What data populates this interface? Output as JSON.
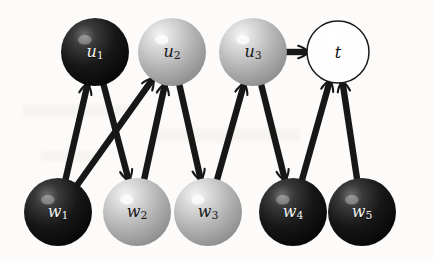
{
  "figure": {
    "kind": "bipartite-graph-diagram",
    "background_color": "#fcfbf9",
    "edge_color": "#171717",
    "node_dark_color": "#161616",
    "node_light_color": "#b9b9b9",
    "node_open_color": "#ffffff",
    "width": 433,
    "height": 261
  },
  "nodes": [
    {
      "id": "u1",
      "label": "u",
      "sub": "1",
      "x": 95,
      "y": 52,
      "r": 34,
      "shade": "dark",
      "row": "top"
    },
    {
      "id": "u2",
      "label": "u",
      "sub": "2",
      "x": 172,
      "y": 52,
      "r": 34,
      "shade": "light",
      "row": "top"
    },
    {
      "id": "u3",
      "label": "u",
      "sub": "3",
      "x": 253,
      "y": 52,
      "r": 34,
      "shade": "light",
      "row": "top"
    },
    {
      "id": "t",
      "label": "t",
      "sub": "",
      "x": 338,
      "y": 52,
      "r": 31,
      "shade": "open",
      "row": "top"
    },
    {
      "id": "w1",
      "label": "w",
      "sub": "1",
      "x": 58,
      "y": 212,
      "r": 34,
      "shade": "dark",
      "row": "bottom"
    },
    {
      "id": "w2",
      "label": "w",
      "sub": "2",
      "x": 137,
      "y": 212,
      "r": 34,
      "shade": "light",
      "row": "bottom"
    },
    {
      "id": "w3",
      "label": "w",
      "sub": "3",
      "x": 208,
      "y": 212,
      "r": 34,
      "shade": "light",
      "row": "bottom"
    },
    {
      "id": "w4",
      "label": "w",
      "sub": "4",
      "x": 293,
      "y": 212,
      "r": 34,
      "shade": "dark",
      "row": "bottom"
    },
    {
      "id": "w5",
      "label": "w",
      "sub": "5",
      "x": 362,
      "y": 212,
      "r": 34,
      "shade": "dark",
      "row": "bottom"
    }
  ],
  "edges": [
    {
      "from": "w1",
      "to": "u1",
      "arrow": "to"
    },
    {
      "from": "w1",
      "to": "u2",
      "arrow": "to"
    },
    {
      "from": "u1",
      "to": "w2",
      "arrow": "to"
    },
    {
      "from": "w2",
      "to": "u2",
      "arrow": "to"
    },
    {
      "from": "u2",
      "to": "w3",
      "arrow": "to"
    },
    {
      "from": "w3",
      "to": "u3",
      "arrow": "to"
    },
    {
      "from": "u3",
      "to": "w4",
      "arrow": "to"
    },
    {
      "from": "u3",
      "to": "t",
      "arrow": "to"
    },
    {
      "from": "w4",
      "to": "t",
      "arrow": "to"
    },
    {
      "from": "w5",
      "to": "t",
      "arrow": "to"
    }
  ],
  "legend": {
    "dark_nodes": [
      "u1",
      "w1",
      "w4",
      "w5"
    ],
    "light_nodes": [
      "u2",
      "u3",
      "w2",
      "w3"
    ],
    "open_nodes": [
      "t"
    ]
  }
}
